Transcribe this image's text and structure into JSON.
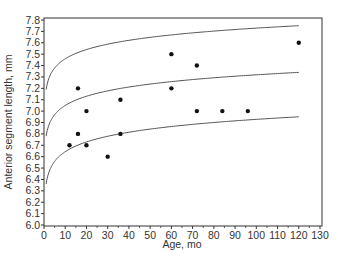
{
  "chart_data": {
    "type": "scatter",
    "title": "",
    "xlabel": "Age, mo",
    "ylabel": "Anterior segment length, mm",
    "xlim": [
      0,
      130
    ],
    "ylim": [
      6.0,
      7.8
    ],
    "xticks": [
      0,
      10,
      20,
      30,
      40,
      50,
      60,
      70,
      80,
      90,
      100,
      110,
      120,
      130
    ],
    "yticks": [
      6.0,
      6.1,
      6.2,
      6.3,
      6.4,
      6.5,
      6.6,
      6.7,
      6.8,
      6.9,
      7.0,
      7.1,
      7.2,
      7.3,
      7.4,
      7.5,
      7.6,
      7.7,
      7.8
    ],
    "xtick_labels": [
      "0",
      "10",
      "20",
      "30",
      "40",
      "50",
      "60",
      "70",
      "80",
      "90",
      "100",
      "110",
      "120",
      "130"
    ],
    "ytick_labels": [
      "6.0",
      "6.1",
      "6.2",
      "6.3",
      "6.4",
      "6.5",
      "6.6",
      "6.7",
      "6.8",
      "6.9",
      "7.0",
      "7.1",
      "7.2",
      "7.3",
      "7.4",
      "7.5",
      "7.6",
      "7.7",
      "7.8"
    ],
    "grid": false,
    "legend": null,
    "points": [
      {
        "x": 12,
        "y": 6.7
      },
      {
        "x": 16,
        "y": 7.2
      },
      {
        "x": 16,
        "y": 6.8
      },
      {
        "x": 20,
        "y": 7.0
      },
      {
        "x": 20,
        "y": 6.7
      },
      {
        "x": 30,
        "y": 6.6
      },
      {
        "x": 36,
        "y": 7.1
      },
      {
        "x": 36,
        "y": 6.8
      },
      {
        "x": 60,
        "y": 7.5
      },
      {
        "x": 60,
        "y": 7.2
      },
      {
        "x": 72,
        "y": 7.4
      },
      {
        "x": 72,
        "y": 7.0
      },
      {
        "x": 84,
        "y": 7.0
      },
      {
        "x": 96,
        "y": 7.0
      },
      {
        "x": 120,
        "y": 7.6
      }
    ],
    "series": [
      {
        "name": "upper curve",
        "type": "line",
        "x": [
          1,
          2,
          4,
          8,
          16,
          30,
          60,
          90,
          120
        ],
        "values": [
          7.19,
          7.27,
          7.35,
          7.43,
          7.51,
          7.58,
          7.66,
          7.71,
          7.75
        ]
      },
      {
        "name": "middle curve",
        "type": "line",
        "x": [
          1,
          2,
          4,
          8,
          16,
          30,
          60,
          90,
          120
        ],
        "values": [
          6.78,
          6.86,
          6.94,
          7.02,
          7.1,
          7.18,
          7.26,
          7.31,
          7.34
        ]
      },
      {
        "name": "lower curve",
        "type": "line",
        "x": [
          1,
          2,
          4,
          8,
          16,
          30,
          60,
          90,
          120
        ],
        "values": [
          6.36,
          6.45,
          6.54,
          6.62,
          6.71,
          6.79,
          6.87,
          6.92,
          6.95
        ]
      }
    ]
  },
  "colors": {
    "axis": "#333333",
    "curve": "#555555",
    "point": "#111111"
  }
}
